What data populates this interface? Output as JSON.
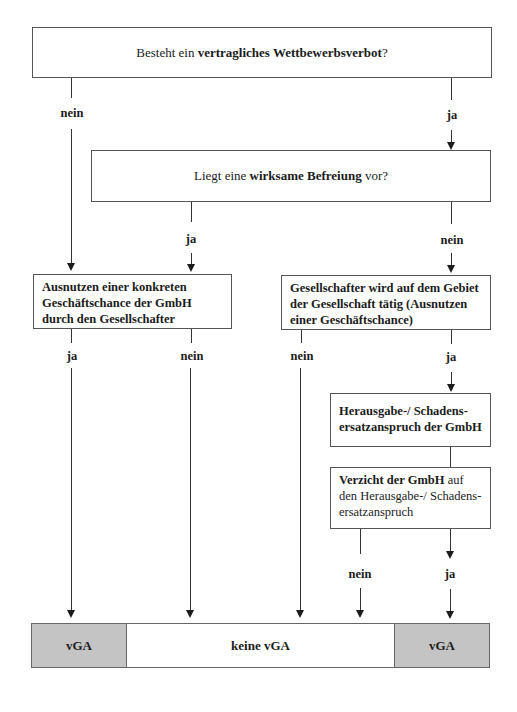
{
  "boxes": {
    "q1": {
      "pre": "Besteht ein ",
      "bold": "vertragliches Wettbewerbsverbot",
      "post": "?"
    },
    "q2": {
      "pre": "Liegt eine ",
      "bold": "wirksame Befreiung",
      "post": " vor?"
    },
    "q3": {
      "text": "Ausnutzen einer konkreten Geschäftschance der GmbH durch den Gesellschafter"
    },
    "q4": {
      "text": "Gesellschafter wird auf dem Gebiet der Gesellschaft tätig (Ausnutzen einer Geschäftschance)"
    },
    "q5": {
      "text": "Herausgabe-/ Schadens-ersatzanspruch der GmbH"
    },
    "q6": {
      "bold": "Verzicht der GmbH",
      "post": " auf den Herausgabe-/ Schadens-ersatzanspruch"
    }
  },
  "labels": {
    "q1_no": "nein",
    "q1_yes": "ja",
    "q2_yes": "ja",
    "q2_no": "nein",
    "q3_yes": "ja",
    "q3_no": "nein",
    "q4_no": "nein",
    "q4_yes": "ja",
    "q6_no": "nein",
    "q6_yes": "ja"
  },
  "outcomes": {
    "left": "vGA",
    "middle": "keine vGA",
    "right": "vGA"
  },
  "colors": {
    "outcome_shaded": "#c4c4c4",
    "line": "#333333"
  }
}
